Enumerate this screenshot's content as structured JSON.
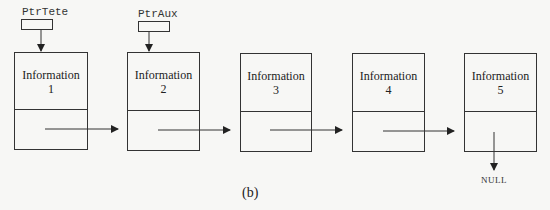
{
  "figure": {
    "caption": "(b)",
    "pointers": [
      {
        "label": "PtrTete",
        "target_node": 1
      },
      {
        "label": "PtrAux",
        "target_node": 2
      }
    ],
    "nodes": [
      {
        "info_label": "Information",
        "index": "1"
      },
      {
        "info_label": "Information",
        "index": "2"
      },
      {
        "info_label": "Information",
        "index": "3"
      },
      {
        "info_label": "Information",
        "index": "4"
      },
      {
        "info_label": "Information",
        "index": "5"
      }
    ],
    "terminator": "NULL",
    "colors": {
      "line": "#333333",
      "background": "#f7f7f5",
      "text": "#222222"
    }
  }
}
